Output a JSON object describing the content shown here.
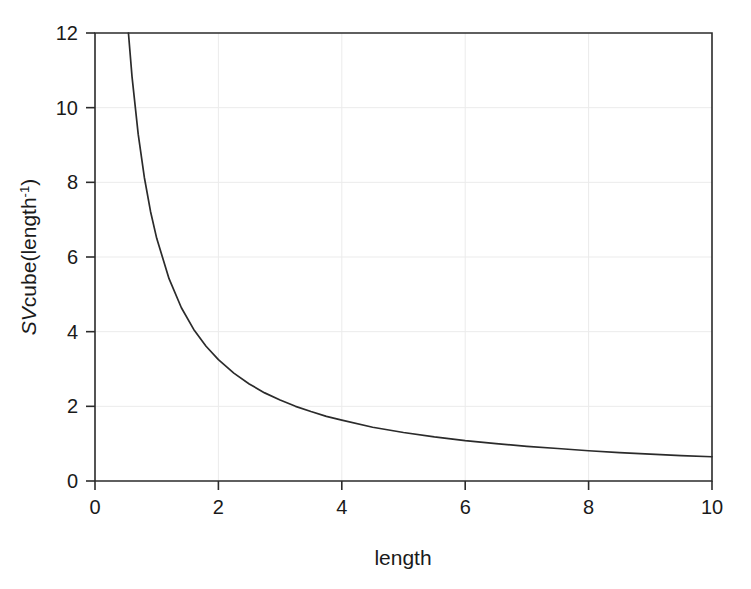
{
  "chart_data": {
    "type": "line",
    "title": "",
    "subtitle": "",
    "xlabel": "length",
    "ylabel": "SVcube(length-1)",
    "ylabel_base": "SV",
    "ylabel_mid": "cube(length",
    "ylabel_sup": "-1",
    "ylabel_tail": ")",
    "xlim": [
      0,
      10
    ],
    "ylim": [
      0,
      12
    ],
    "xticks": [
      0,
      2,
      4,
      6,
      8,
      10
    ],
    "yticks": [
      0,
      2,
      4,
      6,
      8,
      10,
      12
    ],
    "xtick_labels": [
      "0",
      "2",
      "4",
      "6",
      "8",
      "10"
    ],
    "ytick_labels": [
      "0",
      "2",
      "4",
      "6",
      "8",
      "10",
      "12"
    ],
    "grid": true,
    "grid_color": "#ebebeb",
    "legend": null,
    "line_color": "#2b2b2b",
    "axis_color": "#2b2b2b",
    "background_color": "#ffffff",
    "function": "y = 6.5 / x",
    "series": [
      {
        "name": "SVcube",
        "x": [
          0.542,
          0.6,
          0.7,
          0.8,
          0.9,
          1.0,
          1.2,
          1.4,
          1.6,
          1.8,
          2.0,
          2.25,
          2.5,
          2.75,
          3.0,
          3.25,
          3.5,
          3.75,
          4.0,
          4.5,
          5.0,
          5.5,
          6.0,
          6.5,
          7.0,
          7.5,
          8.0,
          8.5,
          9.0,
          9.5,
          10.0
        ],
        "y": [
          12.0,
          10.83,
          9.29,
          8.13,
          7.22,
          6.5,
          5.42,
          4.64,
          4.06,
          3.61,
          3.25,
          2.89,
          2.6,
          2.36,
          2.17,
          2.0,
          1.86,
          1.73,
          1.63,
          1.44,
          1.3,
          1.18,
          1.08,
          1.0,
          0.93,
          0.87,
          0.81,
          0.76,
          0.72,
          0.68,
          0.65
        ]
      }
    ]
  }
}
